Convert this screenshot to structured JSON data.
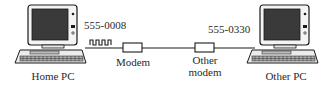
{
  "diagram": {
    "nodes": {
      "home_pc": {
        "label": "Home PC"
      },
      "modem": {
        "label": "Modem"
      },
      "other_modem": {
        "label_line1": "Other",
        "label_line2": "modem"
      },
      "other_pc": {
        "label": "Other PC"
      }
    },
    "phone_numbers": {
      "home": "555-0008",
      "other": "555-0330"
    },
    "signal": {
      "type": "square-wave"
    },
    "colors": {
      "line": "#1a1a1a",
      "screen": "#3a3a3a",
      "background": "#ffffff"
    }
  }
}
